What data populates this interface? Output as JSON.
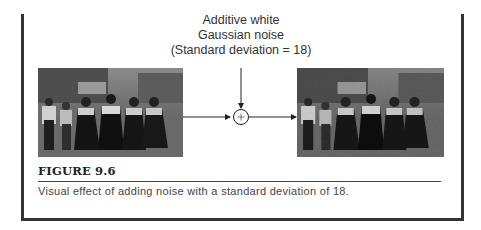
{
  "figure": {
    "noise_label": {
      "line1": "Additive white",
      "line2": "Gaussian noise",
      "line3": "(Standard deviation = 18)"
    },
    "operator_symbol": "+",
    "input_image": {
      "description": "Original grayscale photo of a group of people in folk dress walking on a street"
    },
    "output_image": {
      "description": "Same photo with additive Gaussian noise"
    },
    "title": "FIGURE 9.6",
    "caption": "Visual effect of adding noise with a standard deviation of 18."
  },
  "colors": {
    "frame": "#333333",
    "text": "#222222",
    "caption": "#444444"
  }
}
